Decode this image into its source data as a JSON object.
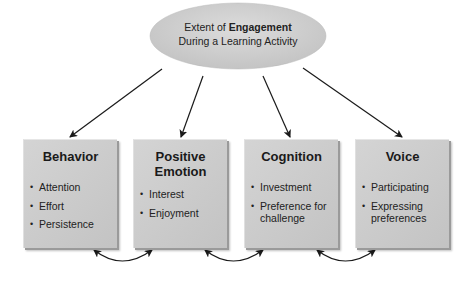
{
  "central": {
    "line1_prefix": "Extent of ",
    "line1_bold": "Engagement",
    "line2": "During a Learning Activity"
  },
  "boxes": [
    {
      "title": "Behavior",
      "items": [
        "Attention",
        "Effort",
        "Persistence"
      ]
    },
    {
      "title_line1": "Positive",
      "title_line2": "Emotion",
      "items": [
        "Interest",
        "Enjoyment"
      ]
    },
    {
      "title": "Cognition",
      "items": [
        "Investment",
        "Preference for challenge"
      ]
    },
    {
      "title": "Voice",
      "items": [
        "Participating",
        "Expressing preferences"
      ]
    }
  ],
  "colors": {
    "ellipse_fill": "#d2d2d2",
    "box_fill": "#c8c8c8",
    "arrow": "#1a1a1a"
  }
}
